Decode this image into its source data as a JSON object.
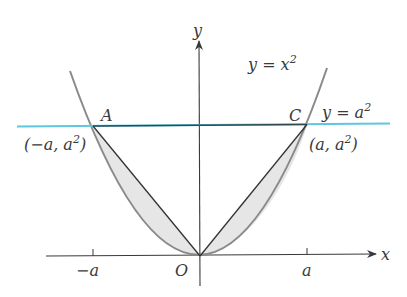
{
  "diagram": {
    "type": "parabola-with-horizontal-line",
    "axes": {
      "x_label": "x",
      "y_label": "y",
      "origin_label": "O",
      "x_ticks": [
        {
          "label": "−a",
          "value": "-a"
        },
        {
          "label": "a",
          "value": "a"
        }
      ]
    },
    "curves": {
      "parabola": {
        "label_lhs": "y = x",
        "label_exp": "2",
        "equation": "y = x^2",
        "color": "#8a8a8a"
      },
      "horizontal_line": {
        "label_lhs": "y = a",
        "label_exp": "2",
        "equation": "y = a^2",
        "color": "#5cc8e0"
      }
    },
    "points": {
      "A": {
        "name": "A",
        "coord_open": "(−a, a",
        "coord_exp": "2",
        "coord_close": ")"
      },
      "C": {
        "name": "C",
        "coord_open": "(a, a",
        "coord_exp": "2",
        "coord_close": ")"
      },
      "O": {
        "name": "O"
      }
    },
    "segments": [
      {
        "from": "O",
        "to": "A",
        "color": "#333333"
      },
      {
        "from": "O",
        "to": "C",
        "color": "#333333"
      },
      {
        "from": "A",
        "to": "C",
        "color": "#333333"
      }
    ],
    "shaded_regions": {
      "description": "Regions between the parabola and segments OA and OC",
      "fill": "#e8e8e8"
    },
    "colors": {
      "axis": "#3a3a3a",
      "parabola": "#8a8a8a",
      "line_y_a2": "#5cc8e0",
      "chord": "#333333",
      "shade": "#e6e6e6",
      "text": "#3a3a3a"
    }
  }
}
